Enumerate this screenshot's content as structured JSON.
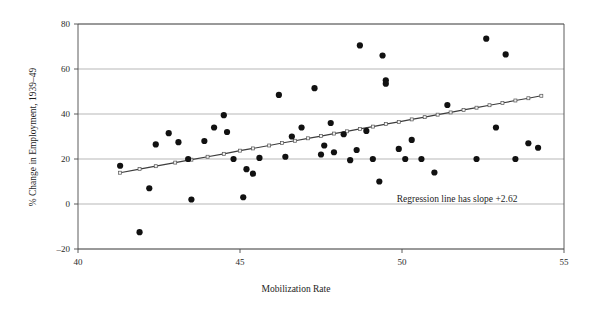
{
  "chart_data": {
    "type": "scatter",
    "title": "",
    "xlabel": "Mobilization Rate",
    "ylabel": "% Change in Employment, 1939–49",
    "xlim": [
      40,
      55
    ],
    "ylim": [
      -20,
      80
    ],
    "xticks": [
      40,
      45,
      50,
      55
    ],
    "xticklabels": [
      "40",
      "45",
      "50",
      "55"
    ],
    "yticks": [
      -20,
      0,
      20,
      40,
      60,
      80
    ],
    "yticklabels": [
      "–20",
      "0",
      "20",
      "40",
      "60",
      "80"
    ],
    "grid": "horizontal",
    "legend": "none",
    "annotations": [
      {
        "text": "Regression line has slope +2.62",
        "x": 51.7,
        "y": 1.0
      }
    ],
    "series": [
      {
        "name": "states",
        "type": "scatter",
        "marker": "filled-circle",
        "color": "#111111",
        "points": [
          [
            41.3,
            17.0
          ],
          [
            41.9,
            -12.5
          ],
          [
            42.2,
            7.0
          ],
          [
            42.4,
            26.5
          ],
          [
            42.8,
            31.5
          ],
          [
            43.1,
            27.5
          ],
          [
            43.4,
            20.0
          ],
          [
            43.5,
            2.0
          ],
          [
            43.9,
            28.0
          ],
          [
            44.2,
            34.0
          ],
          [
            44.5,
            39.5
          ],
          [
            44.6,
            32.0
          ],
          [
            44.8,
            20.0
          ],
          [
            45.1,
            3.0
          ],
          [
            45.2,
            15.5
          ],
          [
            45.4,
            13.5
          ],
          [
            45.6,
            20.5
          ],
          [
            46.2,
            48.5
          ],
          [
            46.4,
            21.0
          ],
          [
            46.6,
            30.0
          ],
          [
            46.9,
            34.0
          ],
          [
            47.3,
            51.5
          ],
          [
            47.5,
            22.0
          ],
          [
            47.6,
            26.0
          ],
          [
            47.8,
            36.0
          ],
          [
            47.9,
            23.0
          ],
          [
            48.2,
            31.0
          ],
          [
            48.4,
            19.5
          ],
          [
            48.6,
            24.0
          ],
          [
            48.7,
            70.5
          ],
          [
            48.9,
            32.5
          ],
          [
            49.1,
            20.0
          ],
          [
            49.3,
            10.0
          ],
          [
            49.4,
            66.0
          ],
          [
            49.5,
            55.0
          ],
          [
            49.5,
            53.5
          ],
          [
            49.9,
            24.5
          ],
          [
            50.1,
            20.0
          ],
          [
            50.3,
            28.5
          ],
          [
            50.6,
            20.0
          ],
          [
            51.0,
            14.0
          ],
          [
            51.4,
            44.0
          ],
          [
            52.3,
            20.0
          ],
          [
            52.6,
            73.5
          ],
          [
            52.9,
            34.0
          ],
          [
            53.2,
            66.5
          ],
          [
            53.5,
            20.0
          ],
          [
            53.9,
            27.0
          ],
          [
            54.2,
            25.0
          ]
        ]
      },
      {
        "name": "regression-line",
        "type": "line",
        "marker": "open-square",
        "slope": 2.62,
        "color": "#3d3d3d",
        "points": [
          [
            41.3,
            13.9
          ],
          [
            41.9,
            15.5
          ],
          [
            42.4,
            16.8
          ],
          [
            43.0,
            18.4
          ],
          [
            43.5,
            19.7
          ],
          [
            44.0,
            21.0
          ],
          [
            44.5,
            22.3
          ],
          [
            45.0,
            23.7
          ],
          [
            45.4,
            24.7
          ],
          [
            45.9,
            26.0
          ],
          [
            46.3,
            27.1
          ],
          [
            46.7,
            28.1
          ],
          [
            47.1,
            29.2
          ],
          [
            47.5,
            30.2
          ],
          [
            47.9,
            31.3
          ],
          [
            48.3,
            32.3
          ],
          [
            48.7,
            33.4
          ],
          [
            49.1,
            34.4
          ],
          [
            49.5,
            35.5
          ],
          [
            49.9,
            36.5
          ],
          [
            50.3,
            37.6
          ],
          [
            50.7,
            38.6
          ],
          [
            51.1,
            39.7
          ],
          [
            51.5,
            40.7
          ],
          [
            51.9,
            41.8
          ],
          [
            52.3,
            42.8
          ],
          [
            52.7,
            43.9
          ],
          [
            53.1,
            44.9
          ],
          [
            53.5,
            46.0
          ],
          [
            53.9,
            47.0
          ],
          [
            54.3,
            48.1
          ]
        ]
      }
    ]
  },
  "layout": {
    "plot_left_px": 78,
    "plot_right_px": 564,
    "plot_top_px": 24,
    "plot_bottom_px": 249
  }
}
